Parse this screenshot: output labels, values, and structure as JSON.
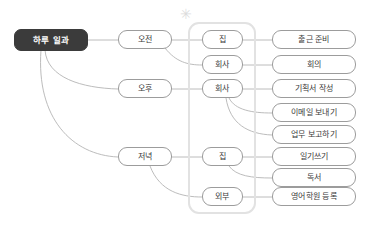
{
  "diagram": {
    "type": "mindmap",
    "title_node": {
      "label": "하루 일과",
      "color": "#3b3b3b",
      "text_color": "#ffffff"
    },
    "marker": {
      "name": "asterisk-marker",
      "glyph": "✳",
      "color": "#dcdcdc"
    },
    "group_box": {
      "name": "location-group",
      "border_color": "#e2e2e2"
    },
    "time_nodes": [
      {
        "id": "morning",
        "label": "오전"
      },
      {
        "id": "afternoon",
        "label": "오후"
      },
      {
        "id": "evening",
        "label": "저녁"
      }
    ],
    "place_nodes": [
      {
        "id": "place-home-1",
        "label": "집"
      },
      {
        "id": "place-office-1",
        "label": "회사"
      },
      {
        "id": "place-office-2",
        "label": "회사"
      },
      {
        "id": "place-home-2",
        "label": "집"
      },
      {
        "id": "place-outside",
        "label": "외부"
      }
    ],
    "task_nodes": [
      {
        "id": "task-1",
        "label": "출근 준비"
      },
      {
        "id": "task-2",
        "label": "회의"
      },
      {
        "id": "task-3",
        "label": "기획서 작성"
      },
      {
        "id": "task-4",
        "label": "이메일 보내기"
      },
      {
        "id": "task-5",
        "label": "업무 보고하기"
      },
      {
        "id": "task-6",
        "label": "일기쓰기"
      },
      {
        "id": "task-7",
        "label": "독서"
      },
      {
        "id": "task-8",
        "label": "영어학원 등록"
      }
    ],
    "edge_color": "#b4b4b4"
  }
}
